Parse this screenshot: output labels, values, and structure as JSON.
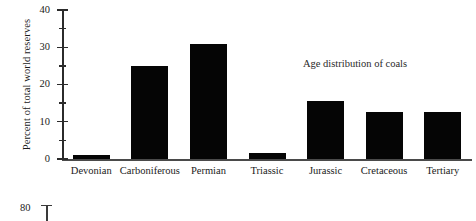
{
  "chart_data": {
    "type": "bar",
    "title": "",
    "annotation": "Age distribution of coals",
    "xlabel": "",
    "ylabel": "Percent of total world reserves",
    "categories": [
      "Devonian",
      "Carboniferous",
      "Permian",
      "Triassic",
      "Jurassic",
      "Cretaceous",
      "Tertiary"
    ],
    "values": [
      1,
      25,
      31,
      1.5,
      15.5,
      12.5,
      12.5
    ],
    "ylim": [
      0,
      40
    ],
    "ytick_labels": [
      "0",
      "10",
      "20",
      "30",
      "40"
    ],
    "ytick_values": [
      0,
      10,
      20,
      30,
      40
    ],
    "yminor_values": [
      5,
      15,
      25,
      35
    ],
    "grid": false,
    "legend": false,
    "bar_color": "#050505",
    "axis_color": "#2b2b2b"
  },
  "next_figure": {
    "ytick_label": "80"
  }
}
